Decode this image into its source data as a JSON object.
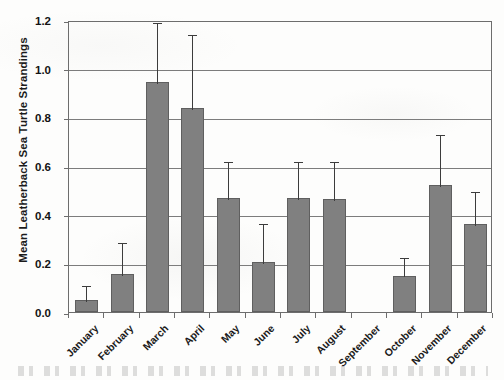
{
  "chart_data": {
    "type": "bar",
    "title": "",
    "subtitle": "",
    "xlabel": "",
    "ylabel": "Mean Leatherback Sea Turtle Strandings",
    "ylim": [
      0.0,
      1.2
    ],
    "yticks": [
      "1.2",
      "1.0",
      "0.8",
      "0.6",
      "0.4",
      "0.2",
      "0.0"
    ],
    "ytick_values": [
      1.2,
      1.0,
      0.8,
      0.6,
      0.4,
      0.2,
      0.0
    ],
    "grid": "horizontal",
    "legend": "none",
    "error_bars": "upper-only",
    "bar_color": "#808080",
    "bar_edge_color": "#5f5f5f",
    "gridline_color": "#7c7c7c",
    "axis_color": "#6d6d6d",
    "categories": [
      "January",
      "February",
      "March",
      "April",
      "May",
      "June",
      "July",
      "August",
      "September",
      "October",
      "November",
      "December"
    ],
    "values": [
      0.05,
      0.155,
      0.945,
      0.84,
      0.47,
      0.205,
      0.47,
      0.465,
      0.0,
      0.15,
      0.52,
      0.36
    ],
    "error_upper": [
      0.115,
      0.29,
      1.195,
      1.145,
      0.625,
      0.37,
      0.625,
      0.625,
      0.0,
      0.23,
      0.735,
      0.5
    ],
    "series": [
      {
        "name": "Mean Leatherback Sea Turtle Strandings",
        "values": [
          0.05,
          0.155,
          0.945,
          0.84,
          0.47,
          0.205,
          0.47,
          0.465,
          0.0,
          0.15,
          0.52,
          0.36
        ]
      }
    ]
  }
}
